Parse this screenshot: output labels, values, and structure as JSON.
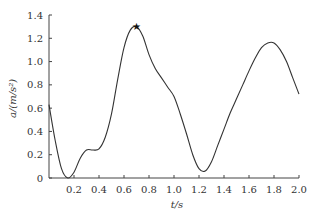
{
  "chart_data": {
    "type": "line",
    "title": "",
    "xlabel": "t/s",
    "ylabel": "a/(m/s²)",
    "xlim": [
      0,
      2.0
    ],
    "ylim": [
      0,
      1.4
    ],
    "x_ticks": [
      "0.2",
      "0.4",
      "0.6",
      "0.8",
      "1.0",
      "1.2",
      "1.4",
      "1.6",
      "1.8",
      "2.0"
    ],
    "y_ticks": [
      "0",
      "0.2",
      "0.4",
      "0.6",
      "0.8",
      "1.0",
      "1.2",
      "1.4"
    ],
    "grid": false,
    "series": [
      {
        "name": "a(t)",
        "x": [
          0,
          0.05,
          0.1,
          0.15,
          0.2,
          0.25,
          0.3,
          0.35,
          0.4,
          0.45,
          0.5,
          0.55,
          0.6,
          0.65,
          0.7,
          0.75,
          0.8,
          0.85,
          0.9,
          0.95,
          1.0,
          1.05,
          1.1,
          1.15,
          1.2,
          1.25,
          1.3,
          1.35,
          1.4,
          1.45,
          1.5,
          1.55,
          1.6,
          1.65,
          1.7,
          1.75,
          1.8,
          1.85,
          1.9,
          1.95,
          2.0
        ],
        "y": [
          0.63,
          0.32,
          0.08,
          0.0,
          0.05,
          0.17,
          0.24,
          0.24,
          0.25,
          0.35,
          0.55,
          0.85,
          1.12,
          1.27,
          1.3,
          1.22,
          1.06,
          0.94,
          0.86,
          0.78,
          0.7,
          0.55,
          0.38,
          0.2,
          0.08,
          0.06,
          0.14,
          0.28,
          0.42,
          0.56,
          0.68,
          0.8,
          0.92,
          1.03,
          1.12,
          1.16,
          1.16,
          1.1,
          1.0,
          0.86,
          0.72
        ]
      }
    ],
    "annotations": [
      {
        "type": "marker",
        "x": 0.7,
        "y": 1.3,
        "symbol": "star"
      }
    ]
  }
}
